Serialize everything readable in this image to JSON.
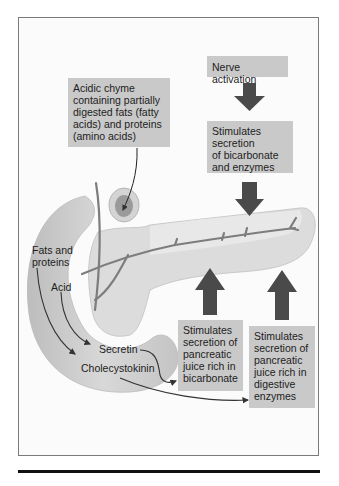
{
  "figure": {
    "labels": {
      "chyme": "Acidic chyme containing partially digested fats (fatty acids) and proteins (amino acids)",
      "nerve": "Nerve activation",
      "stim_bicarb_enzymes": "Stimulates secretion of bicarbonate and enzymes",
      "fats_proteins": "Fats and proteins",
      "acid": "Acid",
      "secretin": "Secretin",
      "cck": "Cholecystokinin",
      "stim_bicarb": "Stimulates secretion of pancreatic juice rich in bicarbonate",
      "stim_enzymes": "Stimulates secretion of pancreatic juice rich in digestive enzymes"
    },
    "chyme_lines": [
      "Acidic chyme",
      "containing partially",
      "digested fats (fatty",
      "acids) and proteins",
      "(amino acids)"
    ],
    "stim1_lines": [
      "Stimulates",
      "secretion",
      "of bicarbonate",
      "and enzymes"
    ],
    "fats_lines": [
      "Fats and",
      "proteins"
    ],
    "bicarb_lines": [
      "Stimulates",
      "secretion of",
      "pancreatic",
      "juice rich in",
      "bicarbonate"
    ],
    "enzyme_lines": [
      "Stimulates",
      "secretion of",
      "pancreatic",
      "juice rich in",
      "digestive",
      "enzymes"
    ]
  },
  "colors": {
    "box_fill": "#c9c9c9",
    "arrow_fill": "#4a4a4a",
    "organ_light": "#d6d6d6",
    "duct": "#7d7d7d"
  }
}
